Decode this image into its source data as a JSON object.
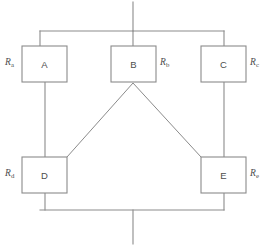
{
  "diagram": {
    "type": "circuit-block-diagram",
    "canvas": {
      "width": 261,
      "height": 248
    },
    "colors": {
      "line": "#8b8b8b",
      "text": "#4d4d4d",
      "background": "#ffffff"
    },
    "blocks": [
      {
        "id": "A",
        "label": "A",
        "x": 22,
        "y": 46,
        "w": 45,
        "h": 36,
        "resistor_symbol": "R",
        "resistor_subscript": "a",
        "label_side": "left"
      },
      {
        "id": "B",
        "label": "B",
        "x": 111,
        "y": 46,
        "w": 45,
        "h": 36,
        "resistor_symbol": "R",
        "resistor_subscript": "b",
        "label_side": "right"
      },
      {
        "id": "C",
        "label": "C",
        "x": 201,
        "y": 46,
        "w": 45,
        "h": 36,
        "resistor_symbol": "R",
        "resistor_subscript": "c",
        "label_side": "right"
      },
      {
        "id": "D",
        "label": "D",
        "x": 22,
        "y": 157,
        "w": 45,
        "h": 36,
        "resistor_symbol": "R",
        "resistor_subscript": "d",
        "label_side": "left"
      },
      {
        "id": "E",
        "label": "E",
        "x": 201,
        "y": 157,
        "w": 45,
        "h": 36,
        "resistor_symbol": "R",
        "resistor_subscript": "e",
        "label_side": "right"
      }
    ],
    "terminals": [
      {
        "name": "top-terminal",
        "x": 133,
        "y1": 2,
        "y2": 31
      },
      {
        "name": "bottom-terminal",
        "x": 133,
        "y1": 210,
        "y2": 244
      }
    ],
    "buses": [
      {
        "name": "top-bus",
        "y": 31,
        "x1": 40,
        "x2": 224
      },
      {
        "name": "bottom-bus",
        "y": 210,
        "x1": 40,
        "x2": 224
      }
    ],
    "connections": [
      {
        "name": "top-bus-to-a",
        "points": "40,31 40,46"
      },
      {
        "name": "top-bus-to-b",
        "points": "133,31 133,46"
      },
      {
        "name": "top-bus-to-c",
        "points": "224,31 224,46"
      },
      {
        "name": "a-to-d",
        "points": "45,82 45,157"
      },
      {
        "name": "c-to-e",
        "points": "224,82 224,157"
      },
      {
        "name": "b-to-d-diagonal",
        "points": "133,83 67,157"
      },
      {
        "name": "b-to-e-diagonal",
        "points": "133,83 201,157"
      },
      {
        "name": "d-to-bottom-bus",
        "points": "45,193 45,210"
      },
      {
        "name": "e-to-bottom-bus",
        "points": "224,193 224,210"
      }
    ]
  }
}
